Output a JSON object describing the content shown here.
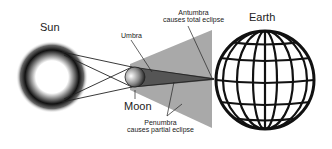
{
  "diagram": {
    "labels": {
      "sun": "Sun",
      "moon": "Moon",
      "earth": "Earth",
      "umbra": "Umbra",
      "antumbra_line1": "Antumbra",
      "antumbra_line2": "causes total eclipse",
      "penumbra_line1": "Penumbra",
      "penumbra_line2": "causes partial eclipse"
    },
    "colors": {
      "penumbra": "#a9a9a9",
      "umbra": "#555555",
      "line": "#222222",
      "sun_ring": "#111111"
    }
  }
}
